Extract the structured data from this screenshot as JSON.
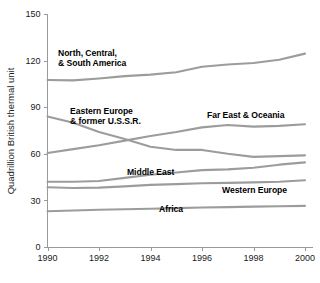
{
  "chart_data": {
    "type": "line",
    "title": "",
    "xlabel": "",
    "ylabel": "Quadrillion British thermal unit",
    "xlim": [
      1990,
      2000
    ],
    "ylim": [
      0,
      150
    ],
    "yticks": [
      0,
      30,
      60,
      90,
      120,
      150
    ],
    "xticks": [
      1990,
      1992,
      1994,
      1996,
      1998,
      2000
    ],
    "xtick_labels": [
      "1990",
      "1992",
      "1994",
      "1996",
      "1998",
      "2000"
    ],
    "ytick_labels": [
      "0",
      "30",
      "60",
      "90",
      "120",
      "150"
    ],
    "grid": false,
    "legend": "inline-labels",
    "line_color": "#9c9c9c",
    "x": [
      1990,
      1991,
      1992,
      1993,
      1994,
      1995,
      1996,
      1997,
      1998,
      1999,
      2000
    ],
    "series": [
      {
        "name": "North, Central, & South America",
        "label": "North, Central,\n& South America",
        "values": [
          107.5,
          107.3,
          108.5,
          110.0,
          111.0,
          112.5,
          116.0,
          117.5,
          118.5,
          120.5,
          124.5
        ]
      },
      {
        "name": "Eastern Europe & former U.S.S.R.",
        "label": "Eastern Europe\n& former U.S.S.R.",
        "values": [
          84.0,
          80.0,
          74.0,
          69.5,
          64.5,
          62.5,
          62.5,
          60.0,
          58.0,
          58.5,
          59.0
        ]
      },
      {
        "name": "Far East & Oceania",
        "label": "Far East & Oceania",
        "values": [
          60.5,
          63.0,
          65.5,
          68.5,
          71.5,
          74.0,
          77.0,
          78.5,
          77.5,
          78.0,
          79.0
        ]
      },
      {
        "name": "Middle East",
        "label": "Middle East",
        "values": [
          42.0,
          42.0,
          42.5,
          44.5,
          46.5,
          48.0,
          49.5,
          50.0,
          51.0,
          53.0,
          54.5
        ]
      },
      {
        "name": "Western Europe",
        "label": "Western Europe",
        "values": [
          38.5,
          38.0,
          38.2,
          39.0,
          40.0,
          40.5,
          41.0,
          41.3,
          41.6,
          42.0,
          43.0
        ]
      },
      {
        "name": "Africa",
        "label": "Africa",
        "values": [
          23.0,
          23.5,
          24.0,
          24.3,
          24.6,
          25.0,
          25.4,
          25.7,
          26.0,
          26.2,
          26.5
        ]
      }
    ],
    "annotations": [
      {
        "name": "north-central-south-america-label",
        "text": "North, Central,\n& South America",
        "x_px": 58,
        "y_px": 48
      },
      {
        "name": "eastern-europe-label",
        "text": "Eastern Europe\n& former U.S.S.R.",
        "x_px": 70,
        "y_px": 106
      },
      {
        "name": "far-east-oceania-label",
        "text": "Far East & Oceania",
        "x_px": 207,
        "y_px": 110
      },
      {
        "name": "middle-east-label",
        "text": "Middle East",
        "x_px": 127,
        "y_px": 167
      },
      {
        "name": "western-europe-label",
        "text": "Western Europe",
        "x_px": 222,
        "y_px": 185
      },
      {
        "name": "africa-label",
        "text": "Africa",
        "x_px": 159,
        "y_px": 204
      }
    ]
  }
}
